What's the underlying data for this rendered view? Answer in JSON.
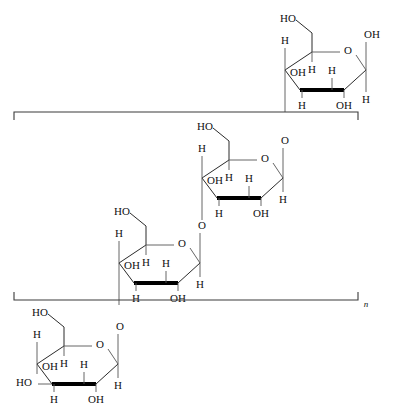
{
  "figure": {
    "repeat_subscript": "n",
    "line_color": "#2b2b2b",
    "bold_bond_color": "#000000",
    "bracket_color": "#3a3a3a",
    "background": "#ffffff"
  },
  "labels": {
    "hydroxyl": "OH",
    "hydroxyl_left": "HO",
    "hydrogen": "H",
    "oxygen": "O"
  },
  "units": [
    {
      "id": "glucose-unit-1",
      "position": "top",
      "c6_label": "HO",
      "ring_oxygen": "O",
      "c1_up": "OH",
      "c1_down": "H",
      "c2_down": "OH",
      "c2_up": "H",
      "c3_down": "H",
      "c3_up": "OH",
      "c4_up": "H",
      "c5_label": "H",
      "left_terminus": null,
      "glycosidic_oxygen": null
    },
    {
      "id": "glucose-unit-2",
      "position": "second",
      "c6_label": "HO",
      "ring_oxygen": "O",
      "c1_up": null,
      "c1_down": "H",
      "c2_down": "OH",
      "c2_up": "H",
      "c3_down": "H",
      "c3_up": "OH",
      "c4_up": "H",
      "c5_label": "H",
      "left_terminus": null,
      "glycosidic_oxygen": "O"
    },
    {
      "id": "glucose-unit-3",
      "position": "third",
      "c6_label": "HO",
      "ring_oxygen": "O",
      "c1_up": null,
      "c1_down": "H",
      "c2_down": "OH",
      "c2_up": "H",
      "c3_down": "H",
      "c3_up": "OH",
      "c4_up": "H",
      "c5_label": "H",
      "left_terminus": null,
      "glycosidic_oxygen": "O"
    },
    {
      "id": "glucose-unit-4",
      "position": "bottom",
      "c6_label": "HO",
      "ring_oxygen": "O",
      "c1_up": null,
      "c1_down": "H",
      "c2_down": "OH",
      "c2_up": "H",
      "c3_down": "H",
      "c3_up": "OH",
      "c4_up": "H",
      "c5_label": "H",
      "left_terminus": "HO",
      "glycosidic_oxygen": "O"
    }
  ],
  "brackets": {
    "top_left_x": 14,
    "top_right_x": 358,
    "top_y": 112,
    "bottom_y": 300,
    "subscript": "n"
  }
}
